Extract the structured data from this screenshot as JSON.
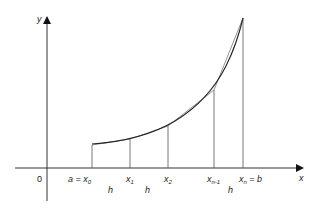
{
  "figure": {
    "axes": {
      "x_label": "x",
      "y_label": "y",
      "origin_label": "0"
    },
    "points": [
      {
        "name": "x0",
        "base": "x",
        "sub": "0",
        "prefix": "a = ",
        "suffix": ""
      },
      {
        "name": "x1",
        "base": "x",
        "sub": "1",
        "prefix": "",
        "suffix": ""
      },
      {
        "name": "x2",
        "base": "x",
        "sub": "2",
        "prefix": "",
        "suffix": ""
      },
      {
        "name": "xn-1",
        "base": "x",
        "sub": "n-1",
        "prefix": "",
        "suffix": ""
      },
      {
        "name": "xn",
        "base": "x",
        "sub": "n",
        "prefix": "",
        "suffix": " = b"
      }
    ],
    "interval_labels": [
      "h",
      "h",
      "h"
    ],
    "colors": {
      "ink": "#222222",
      "curve": "#333333",
      "chord": "#666666",
      "background": "#ffffff"
    }
  }
}
